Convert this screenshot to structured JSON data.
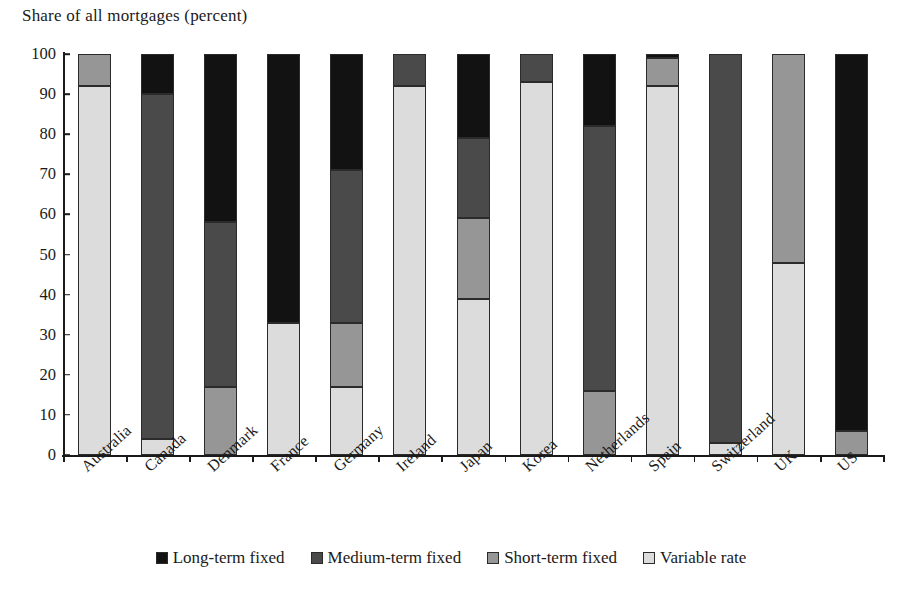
{
  "chart_data": {
    "type": "bar",
    "stacked": true,
    "title": "Share of all mortgages (percent)",
    "xlabel": "",
    "ylabel": "Share of all mortgages (percent)",
    "ylim": [
      0,
      100
    ],
    "yticks": [
      0,
      10,
      20,
      30,
      40,
      50,
      60,
      70,
      80,
      90,
      100
    ],
    "ytick_labels": [
      "0",
      "10",
      "20",
      "30",
      "40",
      "50",
      "60",
      "70",
      "80",
      "90",
      "100"
    ],
    "grid": false,
    "legend_position": "bottom",
    "categories": [
      "Australia",
      "Canada",
      "Denmark",
      "France",
      "Germany",
      "Ireland",
      "Japan",
      "Korea",
      "Netherlands",
      "Spain",
      "Switzerland",
      "UK",
      "US"
    ],
    "series": [
      {
        "name": "Variable rate",
        "color": "#dcdcdc",
        "values": [
          92,
          4,
          0,
          33,
          17,
          92,
          39,
          93,
          0,
          92,
          3,
          48,
          0
        ]
      },
      {
        "name": "Short-term fixed",
        "color": "#969696",
        "values": [
          8,
          0,
          17,
          0,
          16,
          0,
          20,
          0,
          16,
          7,
          0,
          52,
          6
        ]
      },
      {
        "name": "Medium-term fixed",
        "color": "#4a4a4a",
        "values": [
          0,
          86,
          41,
          0,
          38,
          8,
          20,
          7,
          66,
          0,
          97,
          0,
          0
        ]
      },
      {
        "name": "Long-term fixed",
        "color": "#121212",
        "values": [
          0,
          10,
          42,
          67,
          29,
          0,
          21,
          0,
          18,
          1,
          0,
          0,
          94
        ]
      }
    ],
    "stack_order_bottom_to_top": [
      "Variable rate",
      "Short-term fixed",
      "Medium-term fixed",
      "Long-term fixed"
    ]
  },
  "legend": {
    "items": [
      {
        "label": "Long-term fixed",
        "color": "#121212"
      },
      {
        "label": "Medium-term fixed",
        "color": "#4a4a4a"
      },
      {
        "label": "Short-term fixed",
        "color": "#969696"
      },
      {
        "label": "Variable rate",
        "color": "#dcdcdc"
      }
    ]
  }
}
